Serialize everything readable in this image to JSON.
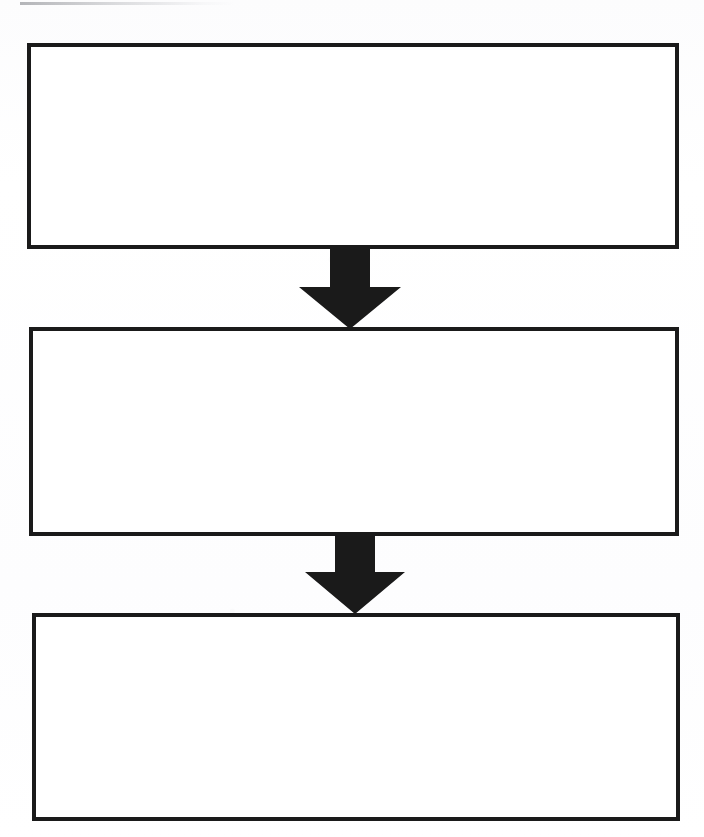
{
  "document": {
    "type": "flowchart",
    "title": "",
    "orientation": "vertical",
    "background_color": "#fdfdfe",
    "stroke_color": "#1a1a1a",
    "fill_color": "#ffffff",
    "canvas": {
      "width": 704,
      "height": 837
    }
  },
  "artifacts": {
    "scan_streak": {
      "name": "scan-streak",
      "x": 20,
      "y": 2,
      "width": 215,
      "height": 3
    }
  },
  "nodes": [
    {
      "id": "node-1",
      "label": "",
      "shape": "rectangle",
      "x": 27,
      "y": 43,
      "width": 652,
      "height": 206
    },
    {
      "id": "node-2",
      "label": "",
      "shape": "rectangle",
      "x": 29,
      "y": 327,
      "width": 650,
      "height": 209
    },
    {
      "id": "node-3",
      "label": "",
      "shape": "rectangle",
      "x": 32,
      "y": 613,
      "width": 648,
      "height": 208
    }
  ],
  "connectors": [
    {
      "id": "arrow-1",
      "label": "",
      "from": "node-1",
      "to": "node-2",
      "direction": "down",
      "x": 297,
      "y": 245,
      "width": 106,
      "height": 84,
      "shaft_width": 40,
      "head_width": 102,
      "head_height": 42,
      "color": "#1a1a1a"
    },
    {
      "id": "arrow-2",
      "label": "",
      "from": "node-2",
      "to": "node-3",
      "direction": "down",
      "x": 303,
      "y": 532,
      "width": 104,
      "height": 82,
      "shaft_width": 40,
      "head_width": 100,
      "head_height": 42,
      "color": "#1a1a1a"
    }
  ]
}
